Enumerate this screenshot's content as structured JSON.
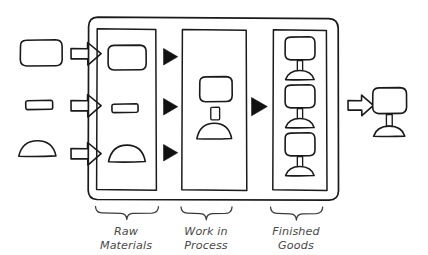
{
  "diagram": {
    "style": "hand-drawn sketch",
    "background_color": "#ffffff",
    "line_color": "#1a1a1a",
    "label_color": "#4a4a4a"
  },
  "inputs": {
    "caption": "",
    "items": [
      {
        "id": "input-body",
        "shape_name": "rounded-rectangle-part",
        "arrow": "block-arrow-right"
      },
      {
        "id": "input-stem",
        "shape_name": "small-bar-part",
        "arrow": "block-arrow-right"
      },
      {
        "id": "input-base",
        "shape_name": "dome-part",
        "arrow": "block-arrow-right"
      }
    ]
  },
  "stages": [
    {
      "id": "raw-materials",
      "label_line1": "Raw",
      "label_line2": "Materials",
      "label_full": "Raw Materials",
      "contents": [
        "rounded-rectangle-part",
        "small-bar-part",
        "dome-part"
      ],
      "outgoing_arrow_count": 3,
      "outgoing_arrow_type": "solid-triangle-right"
    },
    {
      "id": "work-in-process",
      "label_line1": "Work in",
      "label_line2": "Process",
      "label_full": "Work in Process",
      "contents": [
        "partial-assembly"
      ],
      "outgoing_arrow_count": 1,
      "outgoing_arrow_type": "solid-triangle-right"
    },
    {
      "id": "finished-goods",
      "label_line1": "Finished",
      "label_line2": "Goods",
      "label_full": "Finished Goods",
      "contents": [
        "finished-product",
        "finished-product",
        "finished-product"
      ],
      "outgoing_arrow_count": 1,
      "outgoing_arrow_type": "block-arrow-right"
    }
  ],
  "output": {
    "id": "shipped-product",
    "shape_name": "finished-product",
    "arrow": "block-arrow-right"
  }
}
